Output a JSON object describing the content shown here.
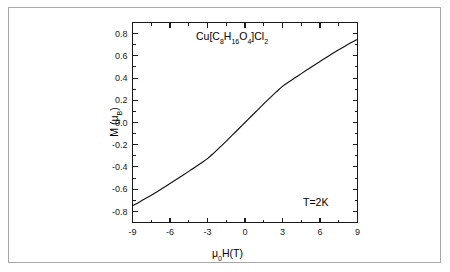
{
  "figure": {
    "background_color": "#ffffff",
    "border_color": "#a8a8a8",
    "curve_color": "#111111",
    "axis_color": "#1a1a1a"
  },
  "annotations": {
    "compound_prefix": "Cu[C",
    "compound_sub1": "8",
    "compound_mid1": "H",
    "compound_sub2": "16",
    "compound_mid2": "O",
    "compound_sub3": "4",
    "compound_suffix": "]Cl",
    "compound_sub4": "2",
    "compound_full": "Cu[C8H16O4]Cl2",
    "temperature": "T=2K"
  },
  "axis_labels": {
    "x_prefix": "μ",
    "x_sub": "0",
    "x_suffix": "H(T)",
    "x_full": "μ0H(T)",
    "y_prefix": "M (μ",
    "y_sub": "B",
    "y_suffix": ")",
    "y_full": "M (μB)"
  },
  "chart_data": {
    "type": "line",
    "title": "",
    "subtitle": "",
    "xlabel": "μ0H(T)",
    "ylabel": "M (μB)",
    "xlim": [
      -9,
      9
    ],
    "ylim": [
      -0.9,
      0.9
    ],
    "xticks": [
      -9,
      -6,
      -3,
      0,
      3,
      6,
      9
    ],
    "xtick_labels": [
      "-9",
      "-6",
      "-3",
      "0",
      "3",
      "6",
      "9"
    ],
    "yticks": [
      -0.8,
      -0.6,
      -0.4,
      -0.2,
      0.0,
      0.2,
      0.4,
      0.6,
      0.8
    ],
    "ytick_labels": [
      "-0.8",
      "-0.6",
      "-0.4",
      "-0.2",
      "0.0",
      "0.2",
      "0.4",
      "0.6",
      "0.8"
    ],
    "x_minor_interval": 1.5,
    "y_minor_interval": 0.1,
    "grid": false,
    "legend": false,
    "tick_direction": "in",
    "series": [
      {
        "name": "M(H) at T=2K",
        "x": [
          -9.0,
          -8.5,
          -8.0,
          -7.5,
          -7.0,
          -6.5,
          -6.0,
          -5.5,
          -5.0,
          -4.5,
          -4.0,
          -3.5,
          -3.0,
          -2.5,
          -2.0,
          -1.5,
          -1.0,
          -0.5,
          0.0,
          0.5,
          1.0,
          1.5,
          2.0,
          2.5,
          3.0,
          3.5,
          4.0,
          4.5,
          5.0,
          5.5,
          6.0,
          6.5,
          7.0,
          7.5,
          8.0,
          8.5,
          9.0
        ],
        "y": [
          -0.75,
          -0.719,
          -0.687,
          -0.654,
          -0.62,
          -0.585,
          -0.549,
          -0.513,
          -0.477,
          -0.44,
          -0.402,
          -0.364,
          -0.325,
          -0.275,
          -0.222,
          -0.167,
          -0.112,
          -0.056,
          0.0,
          0.056,
          0.112,
          0.167,
          0.222,
          0.275,
          0.325,
          0.364,
          0.402,
          0.44,
          0.477,
          0.513,
          0.549,
          0.585,
          0.62,
          0.654,
          0.687,
          0.719,
          0.75
        ]
      }
    ]
  }
}
